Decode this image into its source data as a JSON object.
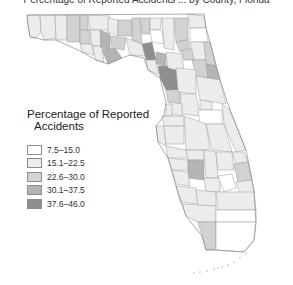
{
  "map": {
    "title": "Percentage of Reported Accidents ... by County, Florida",
    "region": "Florida counties",
    "legend": {
      "title_line1": "Percentage of Reported",
      "title_line2": "Accidents",
      "classes": [
        {
          "label": "7.5–15.0",
          "color": "#ffffff"
        },
        {
          "label": "15.1–22.5",
          "color": "#ececec"
        },
        {
          "label": "22.6–30.0",
          "color": "#d2d2d2"
        },
        {
          "label": "30.1–37.5",
          "color": "#b4b4b4"
        },
        {
          "label": "37.6–46.0",
          "color": "#8e8e8e"
        }
      ]
    }
  }
}
